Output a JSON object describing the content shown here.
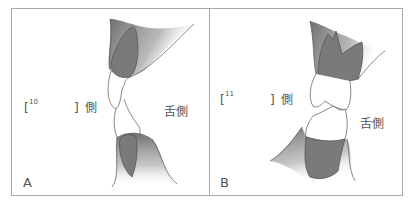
{
  "figure": {
    "panels": [
      {
        "letter": "A",
        "bracket_open": "[",
        "blank_number": "10",
        "bracket_close": "]",
        "side_label": "側",
        "lingual_label": "舌側"
      },
      {
        "letter": "B",
        "bracket_open": "[",
        "blank_number": "11",
        "bracket_close": "]",
        "side_label": "側",
        "lingual_label": "舌側"
      }
    ],
    "colors": {
      "frame": "#a9a9a9",
      "tooth_fill": "#8a8a8a",
      "outline": "#555555",
      "text": "#555555"
    }
  }
}
